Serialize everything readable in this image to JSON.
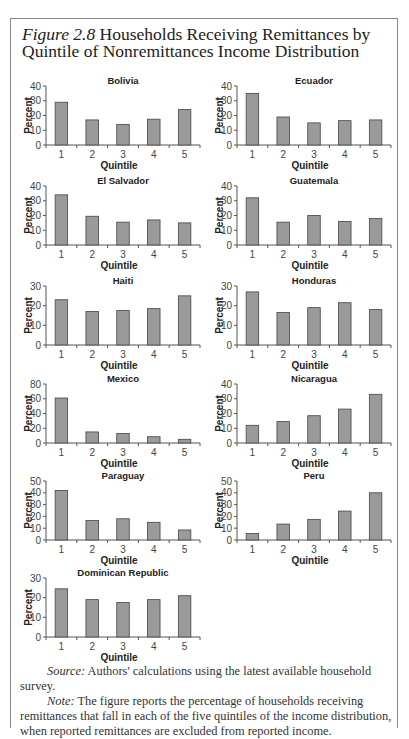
{
  "figure": {
    "label": "Figure 2.8",
    "title": "Households Receiving Remittances by Quintile of Nonremittances Income Distribution"
  },
  "notes": {
    "source_label": "Source:",
    "source_text": "Authors' calculations using the latest available household survey.",
    "note_label": "Note:",
    "note_text": "The figure reports the percentage of households receiving remittances that fall in each of the five quintiles of the income distribution, when reported remittances are excluded from reported income."
  },
  "chart_data": [
    {
      "type": "bar",
      "title": "Bolivia",
      "categories": [
        "1",
        "2",
        "3",
        "4",
        "5"
      ],
      "values": [
        29,
        17,
        14,
        17.5,
        24
      ],
      "xlabel": "Quintile",
      "ylabel": "Percent",
      "ylim": [
        0,
        40
      ],
      "yticks": [
        0,
        10,
        20,
        30,
        40
      ]
    },
    {
      "type": "bar",
      "title": "Ecuador",
      "categories": [
        "1",
        "2",
        "3",
        "4",
        "5"
      ],
      "values": [
        35,
        19,
        15,
        16.5,
        17
      ],
      "xlabel": "Quintile",
      "ylabel": "Percent",
      "ylim": [
        0,
        40
      ],
      "yticks": [
        0,
        10,
        20,
        30,
        40
      ]
    },
    {
      "type": "bar",
      "title": "El Salvador",
      "categories": [
        "1",
        "2",
        "3",
        "4",
        "5"
      ],
      "values": [
        34,
        19.5,
        15.5,
        17,
        15
      ],
      "xlabel": "Quintile",
      "ylabel": "Percent",
      "ylim": [
        0,
        40
      ],
      "yticks": [
        0,
        10,
        20,
        30,
        40
      ]
    },
    {
      "type": "bar",
      "title": "Guatemala",
      "categories": [
        "1",
        "2",
        "3",
        "4",
        "5"
      ],
      "values": [
        32,
        15.5,
        20,
        16,
        18
      ],
      "xlabel": "Quintile",
      "ylabel": "Percent",
      "ylim": [
        0,
        40
      ],
      "yticks": [
        0,
        10,
        20,
        30,
        40
      ]
    },
    {
      "type": "bar",
      "title": "Haiti",
      "categories": [
        "1",
        "2",
        "3",
        "4",
        "5"
      ],
      "values": [
        23,
        17,
        17.5,
        18.5,
        25
      ],
      "xlabel": "Quintile",
      "ylabel": "Percent",
      "ylim": [
        0,
        30
      ],
      "yticks": [
        0,
        10,
        20,
        30
      ]
    },
    {
      "type": "bar",
      "title": "Honduras",
      "categories": [
        "1",
        "2",
        "3",
        "4",
        "5"
      ],
      "values": [
        27,
        16.5,
        19,
        21.5,
        18
      ],
      "xlabel": "Quintile",
      "ylabel": "Percent",
      "ylim": [
        0,
        30
      ],
      "yticks": [
        0,
        10,
        20,
        30
      ]
    },
    {
      "type": "bar",
      "title": "Mexico",
      "categories": [
        "1",
        "2",
        "3",
        "4",
        "5"
      ],
      "values": [
        61,
        15,
        13,
        8.5,
        5
      ],
      "xlabel": "Quintile",
      "ylabel": "Percent",
      "ylim": [
        0,
        80
      ],
      "yticks": [
        0,
        20,
        40,
        60,
        80
      ]
    },
    {
      "type": "bar",
      "title": "Nicaragua",
      "categories": [
        "1",
        "2",
        "3",
        "4",
        "5"
      ],
      "values": [
        12,
        14.5,
        18.5,
        23,
        33
      ],
      "xlabel": "Quintile",
      "ylabel": "Percent",
      "ylim": [
        0,
        40
      ],
      "yticks": [
        0,
        10,
        20,
        30,
        40
      ]
    },
    {
      "type": "bar",
      "title": "Paraguay",
      "categories": [
        "1",
        "2",
        "3",
        "4",
        "5"
      ],
      "values": [
        42,
        16.5,
        18,
        15,
        8.5
      ],
      "xlabel": "Quintile",
      "ylabel": "Percent",
      "ylim": [
        0,
        50
      ],
      "yticks": [
        0,
        10,
        20,
        30,
        40,
        50
      ]
    },
    {
      "type": "bar",
      "title": "Peru",
      "categories": [
        "1",
        "2",
        "3",
        "4",
        "5"
      ],
      "values": [
        5.5,
        13.5,
        17.5,
        24.5,
        40
      ],
      "xlabel": "Quintile",
      "ylabel": "Percent",
      "ylim": [
        0,
        50
      ],
      "yticks": [
        0,
        10,
        20,
        30,
        40,
        50
      ]
    },
    {
      "type": "bar",
      "title": "Dominican Republic",
      "categories": [
        "1",
        "2",
        "3",
        "4",
        "5"
      ],
      "values": [
        24.5,
        19,
        17.5,
        19,
        21
      ],
      "xlabel": "Quintile",
      "ylabel": "Percent",
      "ylim": [
        0,
        30
      ],
      "yticks": [
        0,
        10,
        20,
        30
      ]
    }
  ],
  "style": {
    "bar_fill": "#9a9a9a",
    "bar_stroke": "#444444",
    "axis_color": "#555555",
    "frame_color": "#8a8a8a"
  }
}
